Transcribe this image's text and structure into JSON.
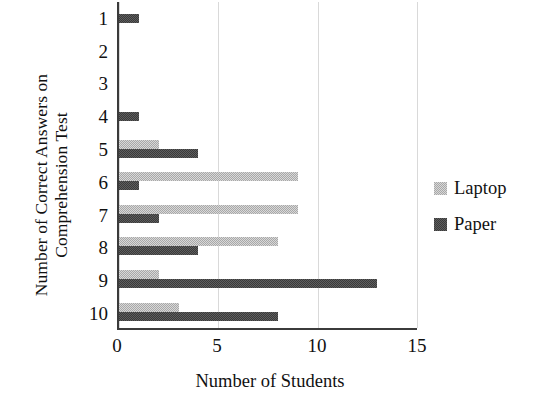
{
  "chart_data": {
    "type": "bar",
    "orientation": "horizontal",
    "title": "",
    "xlabel": "Number of Students",
    "ylabel": "Number of Correct Answers on\nComprehension Test",
    "categories": [
      "1",
      "2",
      "3",
      "4",
      "5",
      "6",
      "7",
      "8",
      "9",
      "10"
    ],
    "series": [
      {
        "name": "Laptop",
        "color": "#a8a8a8",
        "values": [
          0,
          0,
          0,
          0,
          2,
          9,
          9,
          8,
          2,
          3
        ]
      },
      {
        "name": "Paper",
        "color": "#3a3a3a",
        "values": [
          1,
          0,
          0,
          1,
          4,
          1,
          2,
          4,
          13,
          8
        ]
      }
    ],
    "xlim": [
      0,
      15
    ],
    "xticks": [
      "0",
      "5",
      "10",
      "15"
    ],
    "xtick_values": [
      0,
      5,
      10,
      15
    ],
    "grid": "vertical",
    "legend_position": "right"
  },
  "legend": {
    "items": [
      {
        "label": "Laptop",
        "color": "#a8a8a8"
      },
      {
        "label": "Paper",
        "color": "#3a3a3a"
      }
    ]
  }
}
